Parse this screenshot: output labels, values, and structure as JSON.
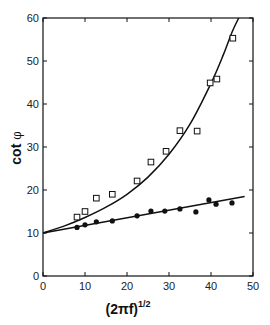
{
  "chart_data": {
    "type": "scatter",
    "title": "",
    "xlabel": "(2πf)",
    "xlabel_sup": "1/2",
    "ylabel": "cot",
    "ylabel_symbol": "φ",
    "xlim": [
      0,
      50
    ],
    "ylim": [
      0,
      60
    ],
    "xticks": [
      0,
      10,
      20,
      30,
      40,
      50
    ],
    "yticks": [
      0,
      10,
      20,
      30,
      40,
      50,
      60
    ],
    "grid": false,
    "legend": "none",
    "series": [
      {
        "name": "open-squares",
        "marker": "open-square",
        "x": [
          8.1,
          10.0,
          12.7,
          16.5,
          22.4,
          25.7,
          29.3,
          32.6,
          36.7,
          39.8,
          41.4,
          45.2
        ],
        "y": [
          13.7,
          15.0,
          18.1,
          19.0,
          22.1,
          26.5,
          29.0,
          33.8,
          33.7,
          44.9,
          45.8,
          55.3
        ]
      },
      {
        "name": "filled-circles",
        "marker": "filled-circle",
        "x": [
          8.1,
          10.0,
          12.7,
          16.5,
          22.4,
          25.7,
          29.0,
          32.6,
          36.4,
          39.5,
          41.2,
          45.0
        ],
        "y": [
          11.3,
          11.9,
          12.6,
          12.8,
          14.0,
          15.1,
          15.1,
          15.6,
          14.9,
          17.7,
          16.7,
          17.0
        ]
      }
    ],
    "fits": [
      {
        "name": "curve-fit",
        "type": "curve",
        "x": [
          0,
          5,
          10,
          15,
          20,
          25,
          30,
          35,
          40,
          43,
          45,
          46.6
        ],
        "y": [
          10.0,
          11.6,
          13.6,
          16.0,
          19.0,
          23.0,
          28.3,
          35.3,
          44.8,
          51.6,
          56.7,
          60.0
        ]
      },
      {
        "name": "linear-fit",
        "type": "line",
        "x": [
          0,
          48
        ],
        "y": [
          10.0,
          18.5
        ]
      }
    ]
  }
}
